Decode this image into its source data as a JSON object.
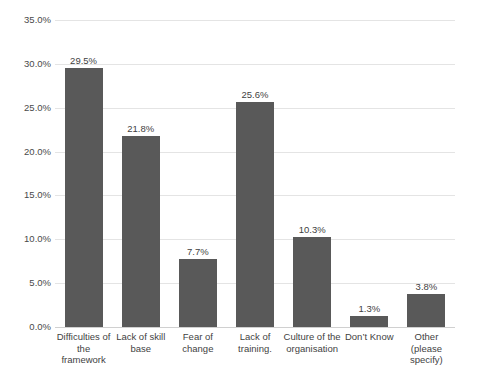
{
  "chart_data": {
    "type": "bar",
    "title": "",
    "xlabel": "",
    "ylabel": "",
    "ylim": [
      0,
      35
    ],
    "grid": true,
    "legend": false,
    "yticks": [
      "0.0%",
      "5.0%",
      "10.0%",
      "15.0%",
      "20.0%",
      "25.0%",
      "30.0%",
      "35.0%"
    ],
    "ytick_values": [
      0,
      5,
      10,
      15,
      20,
      25,
      30,
      35
    ],
    "bar_color": "#595959",
    "gridline_color": "#e4e4e4",
    "categories": [
      "Difficulties of the framework",
      "Lack of skill base",
      "Fear of change",
      "Lack of training.",
      "Culture of the organisation",
      "Don’t Know",
      "Other (please specify)"
    ],
    "values": [
      29.5,
      21.8,
      7.7,
      25.6,
      10.3,
      1.3,
      3.8
    ],
    "data_labels": [
      "29.5%",
      "21.8%",
      "7.7%",
      "25.6%",
      "10.3%",
      "1.3%",
      "3.8%"
    ]
  }
}
